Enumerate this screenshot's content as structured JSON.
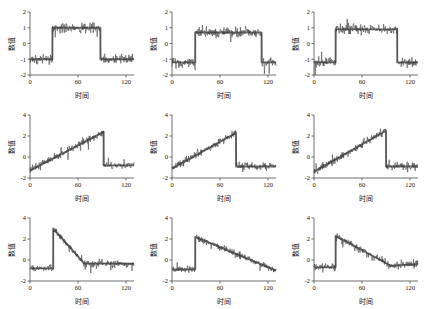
{
  "figure": {
    "title": "",
    "rows": 3,
    "cols": 3,
    "background": "#ffffff",
    "line_color": "#3a3a3a",
    "trend_color": "#6e6e6e",
    "axis_color": "#4d4d4d"
  },
  "labels": {
    "xlabel": "时间",
    "ylabel": "数值",
    "xticks": [
      "0",
      "60",
      "120"
    ],
    "yticks_row1": [
      "2",
      "1",
      "0",
      "-1",
      "-2"
    ],
    "yticks_row2": [
      "4",
      "2",
      "0",
      "-2"
    ],
    "yticks_row3": [
      "4",
      "2",
      "0",
      "-2"
    ]
  },
  "chart_data": [
    {
      "type": "line",
      "title": "",
      "xlabel": "时间",
      "ylabel": "数值",
      "xlim": [
        0,
        130
      ],
      "ylim": [
        -2,
        2
      ],
      "xticks": [
        0,
        60,
        120
      ],
      "yticks": [
        -2,
        -1,
        0,
        1,
        2
      ],
      "grid": false,
      "legend": "none",
      "series": [
        {
          "name": "信号",
          "kind": "noisy",
          "noise": 0.28,
          "x": [
            0,
            5,
            10,
            15,
            20,
            25,
            30,
            35,
            40,
            45,
            50,
            55,
            60,
            65,
            70,
            75,
            80,
            85,
            90,
            95,
            100,
            105,
            110,
            115,
            120,
            125,
            130
          ],
          "values": [
            -1,
            -1,
            -1,
            -1,
            -1,
            -1,
            -1,
            1,
            1,
            1,
            1,
            1,
            1,
            1,
            1,
            1,
            1,
            1,
            -1,
            -1,
            -1,
            -1,
            -1,
            -1,
            -1,
            -1,
            -1
          ]
        },
        {
          "name": "趋势",
          "kind": "smooth",
          "x": [
            0,
            28,
            28,
            88,
            88,
            130
          ],
          "values": [
            -1,
            -1,
            1,
            1,
            -1,
            -1
          ]
        }
      ]
    },
    {
      "type": "line",
      "title": "",
      "xlabel": "时间",
      "ylabel": "数值",
      "xlim": [
        0,
        130
      ],
      "ylim": [
        -2,
        2
      ],
      "xticks": [
        0,
        60,
        120
      ],
      "yticks": [
        -2,
        -1,
        0,
        1,
        2
      ],
      "grid": false,
      "legend": "none",
      "series": [
        {
          "name": "信号",
          "kind": "noisy",
          "noise": 0.3,
          "x": [
            0,
            5,
            10,
            15,
            20,
            25,
            30,
            35,
            40,
            45,
            50,
            55,
            60,
            65,
            70,
            75,
            80,
            85,
            90,
            95,
            100,
            105,
            110,
            115,
            120,
            125,
            130
          ],
          "values": [
            -1.2,
            -1.2,
            -1.2,
            -1.2,
            -1.2,
            -1.2,
            0.7,
            0.7,
            0.7,
            0.7,
            0.7,
            0.7,
            0.7,
            0.7,
            0.7,
            0.7,
            0.7,
            0.7,
            0.7,
            0.7,
            0.7,
            0.7,
            0.7,
            -1.2,
            -1.2,
            -1.2,
            -1.2
          ]
        },
        {
          "name": "趋势",
          "kind": "smooth",
          "x": [
            0,
            29,
            29,
            112,
            112,
            130
          ],
          "values": [
            -1.2,
            -1.2,
            0.7,
            0.7,
            -1.2,
            -1.2
          ]
        }
      ]
    },
    {
      "type": "line",
      "title": "",
      "xlabel": "时间",
      "ylabel": "数值",
      "xlim": [
        0,
        130
      ],
      "ylim": [
        -2,
        2
      ],
      "xticks": [
        0,
        60,
        120
      ],
      "yticks": [
        -2,
        -1,
        0,
        1,
        2
      ],
      "grid": false,
      "legend": "none",
      "series": [
        {
          "name": "信号",
          "kind": "noisy",
          "noise": 0.3,
          "x": [
            0,
            5,
            10,
            15,
            20,
            25,
            30,
            35,
            40,
            45,
            50,
            55,
            60,
            65,
            70,
            75,
            80,
            85,
            90,
            95,
            100,
            105,
            110,
            115,
            120,
            125,
            130
          ],
          "values": [
            -1.2,
            -1.2,
            -1.2,
            -1.2,
            -1.2,
            -1.2,
            0.9,
            0.9,
            0.9,
            0.9,
            0.9,
            0.9,
            0.9,
            0.9,
            0.9,
            0.9,
            0.9,
            0.9,
            0.9,
            0.9,
            0.9,
            -1.2,
            -1.2,
            -1.2,
            -1.2,
            -1.2,
            -1.2
          ]
        },
        {
          "name": "趋势",
          "kind": "smooth",
          "x": [
            0,
            27,
            27,
            104,
            104,
            130
          ],
          "values": [
            -1.2,
            -1.2,
            0.9,
            0.9,
            -1.2,
            -1.2
          ]
        }
      ]
    },
    {
      "type": "line",
      "title": "",
      "xlabel": "时间",
      "ylabel": "数值",
      "xlim": [
        0,
        130
      ],
      "ylim": [
        -2,
        4
      ],
      "xticks": [
        0,
        60,
        120
      ],
      "yticks": [
        -2,
        0,
        2,
        4
      ],
      "grid": false,
      "legend": "none",
      "series": [
        {
          "name": "信号",
          "kind": "noisy",
          "noise": 0.35,
          "x": [
            0,
            10,
            20,
            30,
            40,
            50,
            60,
            70,
            80,
            90,
            95,
            100,
            110,
            120,
            130
          ],
          "values": [
            -1.3,
            -0.9,
            -0.5,
            -0.1,
            0.3,
            0.8,
            1.2,
            1.7,
            2.1,
            2.4,
            -0.8,
            -0.8,
            -0.8,
            -0.8,
            -0.8
          ]
        },
        {
          "name": "趋势",
          "kind": "smooth",
          "x": [
            0,
            92,
            92,
            130
          ],
          "values": [
            -1.3,
            2.4,
            -0.8,
            -0.8
          ]
        }
      ]
    },
    {
      "type": "line",
      "title": "",
      "xlabel": "时间",
      "ylabel": "数值",
      "xlim": [
        0,
        130
      ],
      "ylim": [
        -2,
        4
      ],
      "xticks": [
        0,
        60,
        120
      ],
      "yticks": [
        -2,
        0,
        2,
        4
      ],
      "grid": false,
      "legend": "none",
      "series": [
        {
          "name": "信号",
          "kind": "noisy",
          "noise": 0.35,
          "x": [
            0,
            10,
            20,
            30,
            40,
            50,
            60,
            70,
            78,
            82,
            90,
            100,
            110,
            120,
            130
          ],
          "values": [
            -1.1,
            -0.7,
            -0.3,
            0.2,
            0.7,
            1.2,
            1.7,
            2.1,
            2.3,
            -0.9,
            -0.9,
            -0.9,
            -0.9,
            -0.9,
            -0.9
          ]
        },
        {
          "name": "趋势",
          "kind": "smooth",
          "x": [
            0,
            80,
            80,
            130
          ],
          "values": [
            -1.1,
            2.3,
            -0.9,
            -0.9
          ]
        }
      ]
    },
    {
      "type": "line",
      "title": "",
      "xlabel": "时间",
      "ylabel": "数值",
      "xlim": [
        0,
        130
      ],
      "ylim": [
        -2,
        4
      ],
      "xticks": [
        0,
        60,
        120
      ],
      "yticks": [
        -2,
        0,
        2,
        4
      ],
      "grid": false,
      "legend": "none",
      "series": [
        {
          "name": "信号",
          "kind": "noisy",
          "noise": 0.38,
          "x": [
            0,
            10,
            20,
            30,
            40,
            50,
            60,
            70,
            80,
            88,
            92,
            100,
            110,
            120,
            130
          ],
          "values": [
            -1.4,
            -1.0,
            -0.6,
            -0.1,
            0.4,
            0.9,
            1.4,
            1.9,
            2.3,
            2.5,
            -0.9,
            -0.9,
            -0.9,
            -0.9,
            -0.9
          ]
        },
        {
          "name": "趋势",
          "kind": "smooth",
          "x": [
            0,
            90,
            90,
            130
          ],
          "values": [
            -1.4,
            2.5,
            -0.9,
            -0.9
          ]
        }
      ]
    },
    {
      "type": "line",
      "title": "",
      "xlabel": "时间",
      "ylabel": "数值",
      "xlim": [
        0,
        130
      ],
      "ylim": [
        -2,
        4
      ],
      "xticks": [
        0,
        60,
        120
      ],
      "yticks": [
        -2,
        0,
        2,
        4
      ],
      "grid": false,
      "legend": "none",
      "series": [
        {
          "name": "信号",
          "kind": "noisy",
          "noise": 0.32,
          "x": [
            0,
            8,
            16,
            24,
            30,
            34,
            42,
            50,
            58,
            64,
            72,
            80,
            90,
            100,
            110,
            120,
            130
          ],
          "values": [
            -0.8,
            -0.8,
            -0.8,
            -0.8,
            3.0,
            2.7,
            2.1,
            1.4,
            0.7,
            0.2,
            -0.3,
            -0.4,
            -0.4,
            -0.4,
            -0.4,
            -0.4,
            -0.4
          ]
        },
        {
          "name": "趋势",
          "kind": "smooth",
          "x": [
            0,
            29,
            29,
            68,
            130
          ],
          "values": [
            -0.8,
            -0.8,
            3.0,
            -0.35,
            -0.35
          ]
        }
      ]
    },
    {
      "type": "line",
      "title": "",
      "xlabel": "时间",
      "ylabel": "数值",
      "xlim": [
        0,
        130
      ],
      "ylim": [
        -2,
        4
      ],
      "xticks": [
        0,
        60,
        120
      ],
      "yticks": [
        -2,
        0,
        2,
        4
      ],
      "grid": false,
      "legend": "none",
      "series": [
        {
          "name": "信号",
          "kind": "noisy",
          "noise": 0.32,
          "x": [
            0,
            8,
            16,
            24,
            30,
            40,
            50,
            60,
            70,
            80,
            90,
            100,
            110,
            120,
            130
          ],
          "values": [
            -0.9,
            -0.9,
            -0.9,
            -0.9,
            2.2,
            1.9,
            1.6,
            1.3,
            1.0,
            0.6,
            0.3,
            0.0,
            -0.4,
            -0.8,
            -1.0
          ]
        },
        {
          "name": "趋势",
          "kind": "smooth",
          "x": [
            0,
            29,
            29,
            130
          ],
          "values": [
            -0.9,
            -0.9,
            2.2,
            -1.0
          ]
        }
      ]
    },
    {
      "type": "line",
      "title": "",
      "xlabel": "时间",
      "ylabel": "数值",
      "xlim": [
        0,
        130
      ],
      "ylim": [
        -2,
        4
      ],
      "xticks": [
        0,
        60,
        120
      ],
      "yticks": [
        -2,
        0,
        2,
        4
      ],
      "grid": false,
      "legend": "none",
      "series": [
        {
          "name": "信号",
          "kind": "noisy",
          "noise": 0.36,
          "x": [
            0,
            8,
            16,
            24,
            28,
            36,
            44,
            52,
            60,
            68,
            76,
            84,
            92,
            100,
            110,
            120,
            130
          ],
          "values": [
            -0.7,
            -0.7,
            -0.7,
            -0.7,
            2.3,
            2.0,
            1.7,
            1.3,
            0.9,
            0.5,
            0.1,
            -0.3,
            -0.6,
            -0.5,
            -0.4,
            -0.4,
            -0.4
          ]
        },
        {
          "name": "趋势",
          "kind": "smooth",
          "x": [
            0,
            27,
            27,
            96,
            130
          ],
          "values": [
            -0.7,
            -0.7,
            2.3,
            -0.55,
            -0.4
          ]
        }
      ]
    }
  ]
}
